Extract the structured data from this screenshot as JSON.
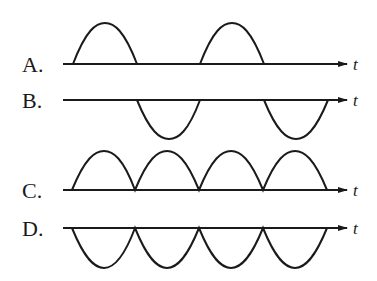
{
  "diagram": {
    "title": "",
    "options": [
      {
        "label": "A.",
        "axis_label": "t",
        "description": "positive half-waves only (half-wave rectified, positive)"
      },
      {
        "label": "B.",
        "axis_label": "t",
        "description": "negative half-waves only (half-wave rectified, negative)"
      },
      {
        "label": "C.",
        "axis_label": "t",
        "description": "full-wave rectified, all positive"
      },
      {
        "label": "D.",
        "axis_label": "t",
        "description": "full-wave rectified, all negative"
      }
    ]
  }
}
